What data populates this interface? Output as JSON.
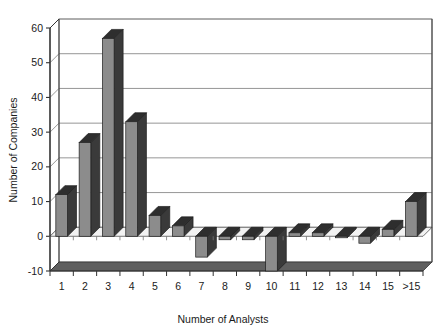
{
  "chart_data": {
    "type": "bar",
    "title": "",
    "subtitle": "",
    "xlabel": "Number of Analysts",
    "ylabel": "Number of Companies",
    "categories": [
      "1",
      "2",
      "3",
      "4",
      "5",
      "6",
      "7",
      "8",
      "9",
      "10",
      "11",
      "12",
      "13",
      "14",
      "15",
      ">15"
    ],
    "values": [
      12,
      27,
      57,
      33,
      6,
      3,
      -6,
      -1,
      -1,
      -10,
      1,
      1,
      0,
      -2,
      2,
      10
    ],
    "ylim": [
      -10,
      60
    ],
    "ytick_values": [
      -10,
      0,
      10,
      20,
      30,
      40,
      50,
      60
    ],
    "ytick_labels": [
      "-10",
      "0",
      "10",
      "20",
      "30",
      "40",
      "50",
      "60"
    ],
    "grid": true,
    "grid_axis": "y",
    "legend": false,
    "legend_position": "none",
    "style": "3d-column",
    "bar_face_color": "#8c8c8c",
    "bar_side_color": "#3a3a3a",
    "bar_top_color": "#2e2e2e",
    "grid_color": "#8a8a8a",
    "axis_color": "#333333",
    "floor_color": "#5f5f5f",
    "background_color": "#ffffff"
  }
}
